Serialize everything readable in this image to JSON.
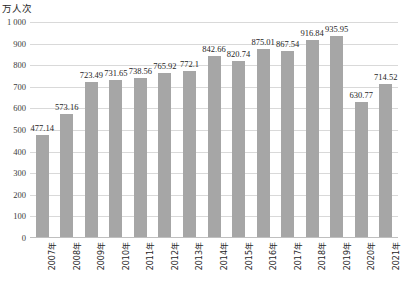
{
  "axis": {
    "unit_caption": "万人次",
    "y_ticks": [
      "1 000",
      "900",
      "800",
      "700",
      "600",
      "500",
      "400",
      "300",
      "200",
      "100",
      "0"
    ]
  },
  "style": {
    "bar_color": "#a6a6a6",
    "gridline_color": "#d9d9d9",
    "text_color": "#262626",
    "background": "#ffffff"
  },
  "chart_data": {
    "type": "bar",
    "title": "",
    "subtitle": "",
    "xlabel": "",
    "ylabel": "万人次",
    "ylim": [
      0,
      1000
    ],
    "ytick_step": 100,
    "grid": true,
    "legend": false,
    "categories": [
      "2007年",
      "2008年",
      "2009年",
      "2010年",
      "2011年",
      "2012年",
      "2013年",
      "2014年",
      "2015年",
      "2016年",
      "2017年",
      "2018年",
      "2019年",
      "2020年",
      "2021年"
    ],
    "values": [
      477.14,
      573.16,
      723.49,
      731.65,
      738.56,
      765.92,
      772.1,
      842.66,
      820.74,
      875.01,
      867.54,
      916.84,
      935.95,
      630.77,
      714.52
    ],
    "data_labels": [
      "477.14",
      "573.16",
      "723.49",
      "731.65",
      "738.56",
      "765.92",
      "772.1",
      "842.66",
      "820.74",
      "875.01",
      "867.54",
      "916.84",
      "935.95",
      "630.77",
      "714.52"
    ]
  }
}
